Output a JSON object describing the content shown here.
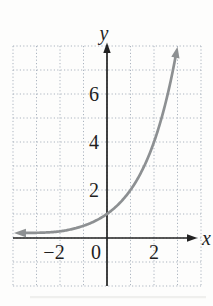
{
  "figure": {
    "background": "#fdfdfc"
  },
  "chart_data": {
    "type": "line",
    "title": "",
    "xlabel": "x",
    "ylabel": "y",
    "xlim": [
      -4,
      4
    ],
    "ylim": [
      -2,
      8
    ],
    "grid": true,
    "grid_style": "dotted",
    "legend": "none",
    "x_ticks": [
      {
        "value": -2,
        "label": "−2"
      },
      {
        "value": 0,
        "label": "0"
      },
      {
        "value": 2,
        "label": "2"
      }
    ],
    "y_ticks": [
      {
        "value": 2,
        "label": "2"
      },
      {
        "value": 4,
        "label": "4"
      },
      {
        "value": 6,
        "label": "6"
      }
    ],
    "series": [
      {
        "name": "exponential-curve",
        "equation": "y = 2^x",
        "base": 2,
        "x_drawn_range": [
          -3.45,
          2.92
        ],
        "asymptote_y": 0,
        "arrow_ends": [
          "left",
          "upper-right"
        ],
        "points": [
          [
            -3,
            0.125
          ],
          [
            -2,
            0.25
          ],
          [
            -1,
            0.5
          ],
          [
            0,
            1
          ],
          [
            1,
            2
          ],
          [
            2,
            4
          ],
          [
            2.9,
            7.5
          ]
        ]
      }
    ],
    "colors": {
      "curve": "#8d9092",
      "grid": "#abb4bf",
      "axis": "#222222",
      "text": "#1f1f1f",
      "scan_shadow": "#ebebe9"
    }
  }
}
